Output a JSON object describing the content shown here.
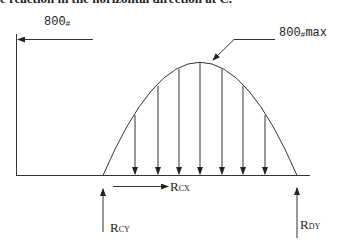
{
  "caption": "e reaction in the horizontal direction at C.",
  "diagram": {
    "horizontal_load": {
      "label_value": "800",
      "label_unit": "#",
      "direction": "left"
    },
    "distributed_load": {
      "shape": "parabolic",
      "peak_label_value": "800",
      "peak_label_unit": "#",
      "peak_label_suffix": "max",
      "arrow_count": 7
    },
    "reactions": {
      "rcx": {
        "main": "R",
        "sub": "CX",
        "direction": "right"
      },
      "rcy": {
        "main": "R",
        "sub": "CY",
        "direction": "up"
      },
      "rdy": {
        "main": "R",
        "sub": "DY",
        "direction": "up"
      }
    },
    "colors": {
      "line": "#333333",
      "arrow": "#222222"
    }
  }
}
